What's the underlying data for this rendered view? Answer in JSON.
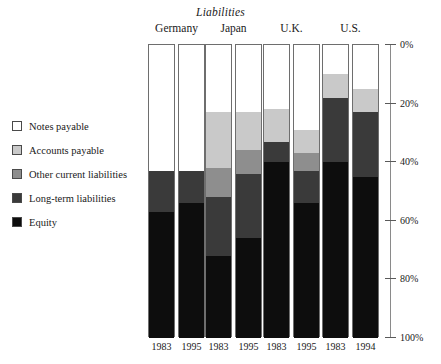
{
  "chart_data": {
    "type": "bar",
    "subtype": "stacked-percentage",
    "title": "Liabilities",
    "xlabel": "",
    "ylabel": "",
    "ylim": [
      0,
      100
    ],
    "yaxis_inverted": true,
    "grid": false,
    "legend_position": "left",
    "yticks": [
      "0%",
      "20%",
      "40%",
      "60%",
      "80%",
      "100%"
    ],
    "ytick_values": [
      0,
      20,
      40,
      60,
      80,
      100
    ],
    "groups": [
      "Germany",
      "Japan",
      "U.K.",
      "U.S."
    ],
    "categories": [
      "1983",
      "1995",
      "1983",
      "1995",
      "1983",
      "1995",
      "1983",
      "1994"
    ],
    "series": [
      {
        "name": "Notes payable",
        "color": "#ffffff",
        "values": [
          43,
          43,
          23,
          23,
          22,
          29,
          10,
          15
        ]
      },
      {
        "name": "Accounts payable",
        "color": "#c9c9c9",
        "values": [
          0,
          0,
          19,
          13,
          11,
          8,
          8,
          8
        ]
      },
      {
        "name": "Other current liabilities",
        "color": "#8e8e8e",
        "values": [
          0,
          0,
          10,
          8,
          0,
          6,
          0,
          0
        ]
      },
      {
        "name": "Long-term liabilities",
        "color": "#3a3a3a",
        "values": [
          14,
          11,
          20,
          22,
          7,
          11,
          22,
          22
        ]
      },
      {
        "name": "Equity",
        "color": "#0d0d0d",
        "values": [
          43,
          46,
          28,
          34,
          60,
          46,
          60,
          55
        ]
      }
    ]
  },
  "legend": {
    "items": [
      {
        "label": "Notes payable",
        "color": "#ffffff"
      },
      {
        "label": "Accounts payable",
        "color": "#c9c9c9"
      },
      {
        "label": "Other current liabilities",
        "color": "#8e8e8e"
      },
      {
        "label": "Long-term liabilities",
        "color": "#3a3a3a"
      },
      {
        "label": "Equity",
        "color": "#0d0d0d"
      }
    ]
  }
}
